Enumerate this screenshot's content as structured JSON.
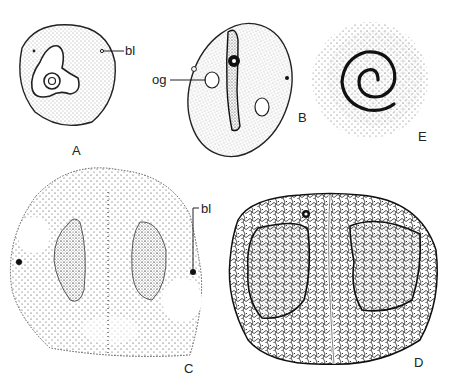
{
  "figure": {
    "panels": [
      {
        "id": "A",
        "label": "A"
      },
      {
        "id": "B",
        "label": "B"
      },
      {
        "id": "C",
        "label": "C"
      },
      {
        "id": "D",
        "label": "D"
      },
      {
        "id": "E",
        "label": "E"
      }
    ],
    "annotations": {
      "a_bl": "bl",
      "b_og": "og",
      "c_bl": "bl"
    }
  }
}
